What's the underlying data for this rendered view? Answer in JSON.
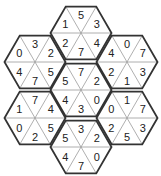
{
  "puzzle": {
    "type": "hexagon-triangle-number-puzzle",
    "colors": {
      "outline": "#333333",
      "inner_lines": "#9a9a9a",
      "text": "#222222",
      "background": "#ffffff"
    },
    "slot_order": [
      "upper-left",
      "top",
      "upper-right",
      "lower-right",
      "bottom",
      "lower-left"
    ],
    "hexagons": [
      {
        "id": "top",
        "cx": 81,
        "cy": 33,
        "values": [
          "1",
          "5",
          "3",
          "4",
          "7",
          "2"
        ]
      },
      {
        "id": "upper-left",
        "cx": 35,
        "cy": 62,
        "values": [
          "0",
          "3",
          "2",
          "5",
          "7",
          "4"
        ]
      },
      {
        "id": "upper-right",
        "cx": 127,
        "cy": 62,
        "values": [
          "4",
          "0",
          "7",
          "3",
          "1",
          "2"
        ]
      },
      {
        "id": "center",
        "cx": 81,
        "cy": 90,
        "values": [
          "5",
          "7",
          "2",
          "0",
          "3",
          "4"
        ]
      },
      {
        "id": "lower-left",
        "cx": 35,
        "cy": 118,
        "values": [
          "1",
          "7",
          "4",
          "5",
          "2",
          "0"
        ]
      },
      {
        "id": "lower-right",
        "cx": 127,
        "cy": 118,
        "values": [
          "0",
          "1",
          "7",
          "3",
          "5",
          "2"
        ]
      },
      {
        "id": "bottom",
        "cx": 81,
        "cy": 147,
        "values": [
          "5",
          "3",
          "2",
          "0",
          "7",
          "4"
        ]
      }
    ]
  }
}
